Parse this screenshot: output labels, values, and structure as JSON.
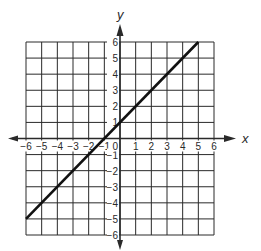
{
  "chart_data": {
    "type": "line",
    "title": "",
    "xlabel": "x",
    "ylabel": "y",
    "xlim": [
      -6,
      6
    ],
    "ylim": [
      -6,
      6
    ],
    "grid": true,
    "grid_step": 1,
    "x_ticks": [
      "-6",
      "-5",
      "-4",
      "-3",
      "-2",
      "-1",
      "0",
      "1",
      "2",
      "3",
      "4",
      "5",
      "6"
    ],
    "y_ticks": [
      "-6",
      "-5",
      "-4",
      "-3",
      "-2",
      "-1",
      "1",
      "2",
      "3",
      "4",
      "5",
      "6"
    ],
    "origin_label": "0",
    "series": [
      {
        "name": "y = x + 1",
        "x": [
          -6,
          5
        ],
        "y": [
          -5,
          6
        ],
        "slope": 1,
        "intercept": 1
      }
    ],
    "legend": null
  },
  "colors": {
    "grid": "#2a2a2a",
    "line": "#111111",
    "text": "#2a2a2a",
    "background": "#ffffff"
  }
}
